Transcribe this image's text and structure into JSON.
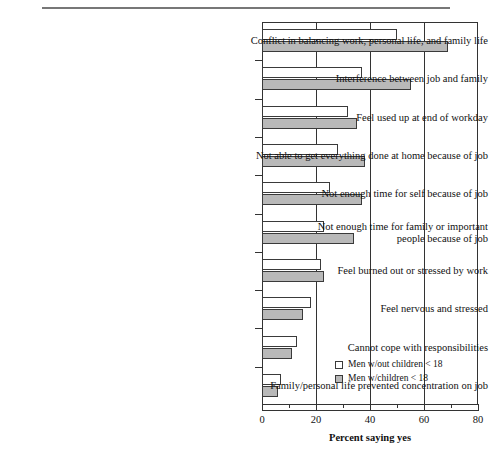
{
  "figure": {
    "has_top_rule": true
  },
  "legend": {
    "position": "inside-bottom-right",
    "items": [
      {
        "label": "Men w/out children < 18",
        "style": "open"
      },
      {
        "label": "Men w/children < 18",
        "style": "solid"
      }
    ]
  },
  "axis": {
    "x_title": "Percent saying yes",
    "x_ticks": [
      "0",
      "20",
      "40",
      "60",
      "80"
    ]
  },
  "chart_data": {
    "type": "bar",
    "orientation": "horizontal",
    "title": "",
    "subtitle": "",
    "xlabel": "Percent saying yes",
    "ylabel": "",
    "xlim": [
      0,
      80
    ],
    "x_ticks": [
      0,
      20,
      40,
      60,
      80
    ],
    "x_minor_ticks": [
      10,
      30,
      50,
      70
    ],
    "grid": "vertical-major",
    "legend_position": "inside-bottom-right",
    "categories": [
      "Conflict in balancing work, personal life, and family life",
      "Interference between job and family",
      "Feel used up at end of workday",
      "Not able to get everything done at home because of job",
      "Not enough time for self because of job",
      "Not enough time for family or important\npeople because of job",
      "Feel burned out or stressed by work",
      "Feel nervous and stressed",
      "Cannot cope with responsibilities",
      "Family/personal life prevented concentration on job"
    ],
    "series": [
      {
        "name": "Men w/out children < 18",
        "style": "open",
        "values": [
          50,
          37,
          32,
          28,
          25,
          23,
          22,
          18,
          13,
          7
        ]
      },
      {
        "name": "Men w/children < 18",
        "style": "solid",
        "values": [
          69,
          55,
          35,
          38,
          37,
          34,
          23,
          15,
          11,
          6
        ]
      }
    ]
  }
}
